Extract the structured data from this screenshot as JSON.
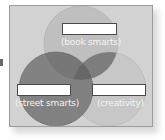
{
  "diagram": {
    "type": "venn",
    "sets": [
      {
        "id": "top",
        "caption": "(book smarts)",
        "fill": "#bdbdbd",
        "label_value": ""
      },
      {
        "id": "bottom-left",
        "caption": "(street smarts)",
        "fill": "#7a7a7a",
        "label_value": ""
      },
      {
        "id": "bottom-right",
        "caption": "(creativity)",
        "fill": "#c4c4c4",
        "label_value": ""
      }
    ],
    "colors": {
      "panel_bg": "#d2d2d2",
      "panel_border": "#9c9c9c",
      "center_overlap": "#5e5e5e",
      "label_box_border": "#4a4a4a"
    }
  }
}
